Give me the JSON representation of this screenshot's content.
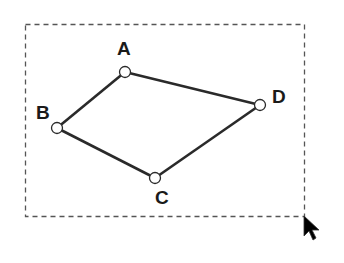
{
  "diagram": {
    "title": "",
    "selection": {
      "style": "dashed",
      "color": "#555555"
    },
    "shape": {
      "type": "quadrilateral",
      "stroke": "#2a2a2a",
      "vertices": [
        "A",
        "D",
        "C",
        "B"
      ]
    },
    "vertices": [
      {
        "id": "A",
        "label": "A"
      },
      {
        "id": "B",
        "label": "B"
      },
      {
        "id": "C",
        "label": "C"
      },
      {
        "id": "D",
        "label": "D"
      }
    ],
    "edges": [
      {
        "from": "A",
        "to": "D"
      },
      {
        "from": "D",
        "to": "C"
      },
      {
        "from": "C",
        "to": "B"
      },
      {
        "from": "B",
        "to": "A"
      }
    ],
    "cursor": {
      "icon": "arrow-cursor-icon"
    }
  }
}
